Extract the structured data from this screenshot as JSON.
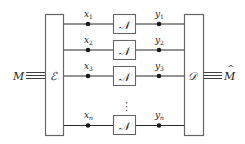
{
  "diagram": {
    "type": "block-diagram",
    "input": {
      "label": "M"
    },
    "output": {
      "label": "M̂",
      "base": "M",
      "accent": "^"
    },
    "encoder": {
      "label": "ℰ"
    },
    "decoder": {
      "label": "𝒟"
    },
    "channels": [
      {
        "input_label": "x",
        "input_sub": "1",
        "channel_label": "𝒩",
        "output_label": "y",
        "output_sub": "1"
      },
      {
        "input_label": "x",
        "input_sub": "2",
        "channel_label": "𝒩",
        "output_label": "y",
        "output_sub": "2"
      },
      {
        "input_label": "x",
        "input_sub": "3",
        "channel_label": "𝒩",
        "output_label": "y",
        "output_sub": "3"
      },
      {
        "input_label": "x",
        "input_sub": "n",
        "channel_label": "𝒩",
        "output_label": "y",
        "output_sub": "n"
      }
    ],
    "ellipsis": "⋮",
    "colors": {
      "line": "#2a2a2a",
      "box_border": "#666666",
      "dot": "#1a1a1a",
      "background": "#ffffff"
    }
  }
}
